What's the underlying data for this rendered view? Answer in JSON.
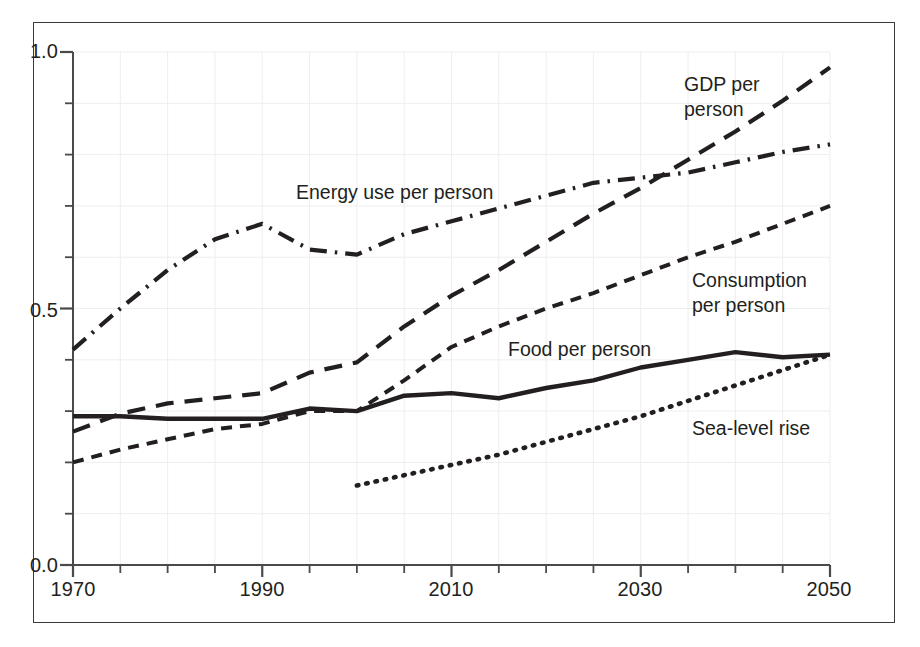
{
  "figure": {
    "background": "#ffffff",
    "frame_color": "#3a3a3a",
    "ink_color": "#231f20"
  },
  "axes": {
    "y_ticks_major": [
      "1.0",
      "0.5",
      "0.0"
    ],
    "x_ticks_major": [
      "1970",
      "1990",
      "2010",
      "2030",
      "2050"
    ]
  },
  "labels": {
    "gdp": "GDP per\nperson",
    "gdp_line1": "GDP per",
    "gdp_line2": "person",
    "energy": "Energy use per person",
    "consumption_line1": "Consumption",
    "consumption_line2": "per person",
    "food": "Food per person",
    "sea": "Sea-level rise"
  },
  "chart_data": {
    "type": "line",
    "title": "",
    "xlabel": "",
    "ylabel": "",
    "xlim": [
      1970,
      2050
    ],
    "ylim": [
      0.0,
      1.0
    ],
    "xticks": [
      1970,
      1990,
      2010,
      2030,
      2050
    ],
    "xticks_minor_step": 5,
    "yticks": [
      0.0,
      0.5,
      1.0
    ],
    "yticks_minor_step": 0.1,
    "grid": true,
    "grid_color": "#eeeeee",
    "legend": "inline-annotations",
    "x": [
      1970,
      1975,
      1980,
      1985,
      1990,
      1995,
      2000,
      2005,
      2010,
      2015,
      2020,
      2025,
      2030,
      2035,
      2040,
      2045,
      2050
    ],
    "series": [
      {
        "name": "GDP per person",
        "style": "long-dash",
        "dash": "18,11",
        "width": 4.2,
        "color": "#231f20",
        "x": [
          1970,
          1975,
          1980,
          1985,
          1990,
          1995,
          2000,
          2005,
          2010,
          2015,
          2020,
          2025,
          2030,
          2035,
          2040,
          2045,
          2050
        ],
        "values": [
          0.26,
          0.295,
          0.315,
          0.325,
          0.335,
          0.375,
          0.395,
          0.465,
          0.525,
          0.575,
          0.63,
          0.685,
          0.735,
          0.79,
          0.845,
          0.905,
          0.97
        ]
      },
      {
        "name": "Energy use per person",
        "style": "dash-dot",
        "dash": "17,8,2.5,8",
        "width": 4.2,
        "color": "#231f20",
        "x": [
          1970,
          1975,
          1980,
          1985,
          1990,
          1995,
          2000,
          2005,
          2010,
          2015,
          2020,
          2025,
          2030,
          2035,
          2040,
          2045,
          2050
        ],
        "values": [
          0.42,
          0.5,
          0.575,
          0.635,
          0.665,
          0.615,
          0.605,
          0.645,
          0.67,
          0.695,
          0.72,
          0.745,
          0.755,
          0.765,
          0.785,
          0.805,
          0.82
        ]
      },
      {
        "name": "Consumption per person",
        "style": "short-dash",
        "dash": "11,8",
        "width": 4.0,
        "color": "#231f20",
        "x": [
          1970,
          1975,
          1980,
          1985,
          1990,
          1995,
          2000,
          2005,
          2010,
          2015,
          2020,
          2025,
          2030,
          2035,
          2040,
          2045,
          2050
        ],
        "values": [
          0.2,
          0.225,
          0.245,
          0.265,
          0.275,
          0.3,
          0.3,
          0.36,
          0.425,
          0.465,
          0.5,
          0.53,
          0.565,
          0.6,
          0.63,
          0.665,
          0.7
        ]
      },
      {
        "name": "Food per person",
        "style": "solid",
        "dash": "none",
        "width": 4.4,
        "color": "#231f20",
        "x": [
          1970,
          1975,
          1980,
          1985,
          1990,
          1995,
          2000,
          2005,
          2010,
          2015,
          2020,
          2025,
          2030,
          2035,
          2040,
          2045,
          2050
        ],
        "values": [
          0.29,
          0.29,
          0.285,
          0.285,
          0.285,
          0.305,
          0.3,
          0.33,
          0.335,
          0.325,
          0.345,
          0.36,
          0.385,
          0.4,
          0.415,
          0.405,
          0.41
        ]
      },
      {
        "name": "Sea-level rise",
        "style": "dotted",
        "dash": "1.5,8",
        "width": 4.6,
        "color": "#231f20",
        "x": [
          2000,
          2005,
          2010,
          2015,
          2020,
          2025,
          2030,
          2035,
          2040,
          2045,
          2050
        ],
        "values": [
          0.155,
          0.175,
          0.195,
          0.215,
          0.24,
          0.265,
          0.29,
          0.32,
          0.35,
          0.38,
          0.41
        ]
      }
    ]
  }
}
